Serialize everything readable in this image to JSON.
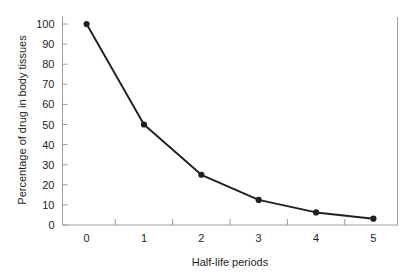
{
  "chart_data": {
    "type": "line",
    "title": "",
    "xlabel": "Half-life periods",
    "ylabel": "Percentage of drug in body tissues",
    "x": [
      0,
      1,
      2,
      3,
      4,
      5
    ],
    "values": [
      100,
      50,
      25,
      12.5,
      6.25,
      3.125
    ],
    "series": [
      {
        "name": "Percentage of drug in body tissues",
        "values": [
          100,
          50,
          25,
          12.5,
          6.25,
          3.125
        ]
      }
    ],
    "xlim": [
      -0.42,
      5.42
    ],
    "ylim": [
      0,
      104
    ],
    "xticklabels": [
      "0",
      "1",
      "2",
      "3",
      "4",
      "5"
    ],
    "yticklabels": [
      "0",
      "10",
      "20",
      "30",
      "40",
      "50",
      "60",
      "70",
      "80",
      "90",
      "100"
    ],
    "ytickvalues": [
      0,
      10,
      20,
      30,
      40,
      50,
      60,
      70,
      80,
      90,
      100
    ],
    "xtickmark_positions": [
      -0.42,
      0.5,
      1.5,
      2.5,
      3.5,
      4.5,
      5.42
    ],
    "grid": false,
    "legend": null,
    "marker": "filled-circle",
    "line_color": "#231f20",
    "marker_color": "#231f20",
    "axis_color": "#9d9fa2",
    "background": "#ffffff"
  }
}
